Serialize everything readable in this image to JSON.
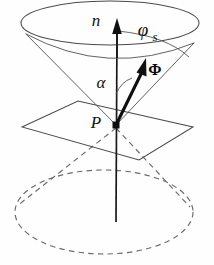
{
  "figure": {
    "name": "scattering-cone-diagram",
    "background_color": "#fefefe",
    "line_color": "#4a4a4a",
    "accent_color": "#101010",
    "width": 214,
    "height": 265
  },
  "labels": {
    "normal": "n",
    "alpha": "α",
    "point": "P",
    "phi_symbol": "φ",
    "phi_subscript": "s",
    "flux": "Φ"
  },
  "geometry": {
    "apex": {
      "x": 116,
      "y": 125
    },
    "top_ellipse": {
      "cx": 110,
      "cy": 23,
      "rx": 89,
      "ry": 22
    },
    "bottom_dashed_ellipse": {
      "cx": 104,
      "cy": 212,
      "rx": 89,
      "ry": 42
    },
    "plane_vertices": [
      {
        "x": 22,
        "y": 127
      },
      {
        "x": 78,
        "y": 101
      },
      {
        "x": 193,
        "y": 127
      },
      {
        "x": 139,
        "y": 160
      }
    ],
    "normal_axis": {
      "x1": 116,
      "y1": 222,
      "x2": 117,
      "y2": 26
    },
    "flux_vector": {
      "x1": 116,
      "y1": 125,
      "x2": 146,
      "y2": 63
    },
    "cone_slant_left": {
      "x1": 116,
      "y1": 125,
      "x2": 26,
      "y2": 35
    },
    "cone_slant_right": {
      "x1": 116,
      "y1": 125,
      "x2": 194,
      "y2": 44
    },
    "alpha_arc_label_pos": {
      "x": 105,
      "y": 84
    },
    "phis_arc_label_pos": {
      "x": 148,
      "y": 33
    },
    "flux_label_pos": {
      "x": 153,
      "y": 72
    },
    "point_label_pos": {
      "x": 98,
      "y": 124
    },
    "normal_label_pos": {
      "x": 102,
      "y": 22
    }
  }
}
